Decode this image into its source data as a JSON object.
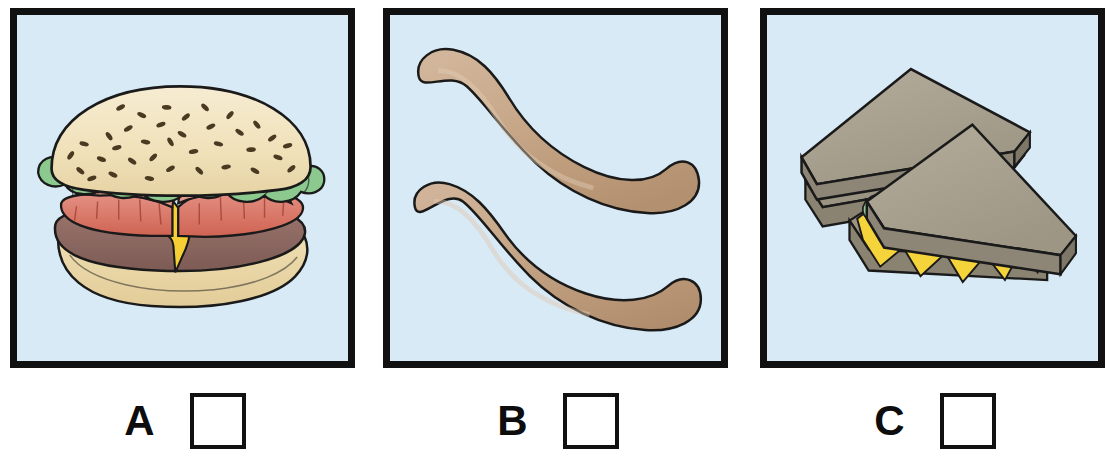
{
  "worksheet": {
    "title": "Food picture multiple-choice row",
    "background_color": "#ffffff",
    "panel_count": 3
  },
  "panels": [
    {
      "id": "panel-a",
      "letter": "A",
      "subject": "hamburger",
      "subject_label": "Hamburger with sesame seed bun, lettuce, tomato, cheese and patty",
      "item_count": 1,
      "background_color": "#d8eaf6",
      "border_color": "#111111",
      "checkbox_checked": false,
      "colors": {
        "bun": "#f2e4bf",
        "bun_shade": "#e2cfa0",
        "sesame": "#4a3a22",
        "lettuce": "#8cc98f",
        "lettuce_shade": "#6fb177",
        "tomato": "#d66b5c",
        "tomato_light": "#e39184",
        "patty": "#8d6a63",
        "cheese": "#f5cf34",
        "outline": "#1a1a1a"
      }
    },
    {
      "id": "panel-b",
      "letter": "B",
      "subject": "sausages",
      "subject_label": "Two plain curved sausages / hot dog links",
      "item_count": 2,
      "background_color": "#d8eaf6",
      "border_color": "#111111",
      "checkbox_checked": false,
      "colors": {
        "sausage": "#c3a183",
        "sausage_light": "#d4b79c",
        "sausage_shade": "#b18f72",
        "outline": "#1a1a1a"
      }
    },
    {
      "id": "panel-c",
      "letter": "C",
      "subject": "sandwiches",
      "subject_label": "Two triangular club sandwiches with lettuce, cheese and ham",
      "item_count": 2,
      "background_color": "#d8eaf6",
      "border_color": "#111111",
      "checkbox_checked": false,
      "colors": {
        "bread_top": "#a9a291",
        "bread_edge": "#8d8677",
        "bread_side": "#9b9483",
        "lettuce": "#8fc99a",
        "cheese": "#f5d33a",
        "ham": "#e8a184",
        "ham_light": "#f3ded0",
        "tomato": "#cc5b47",
        "outline": "#1a1a1a"
      }
    }
  ]
}
